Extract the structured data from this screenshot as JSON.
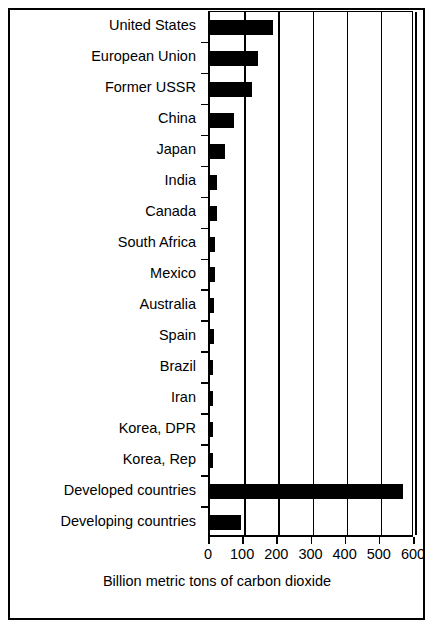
{
  "chart_data": {
    "type": "bar",
    "orientation": "horizontal",
    "title": "",
    "xlabel": "Billion metric tons of carbon dioxide",
    "ylabel": "",
    "xlim": [
      0,
      600
    ],
    "xticks": [
      0,
      100,
      200,
      300,
      400,
      500,
      600
    ],
    "xtick_labels": [
      "0",
      "100",
      "200",
      "300",
      "400",
      "500",
      "600"
    ],
    "grid": "vertical",
    "legend": "none",
    "bar_color": "#000000",
    "background_color": "#ffffff",
    "categories": [
      "United States",
      "European Union",
      "Former USSR",
      "China",
      "Japan",
      "India",
      "Canada",
      "South Africa",
      "Mexico",
      "Australia",
      "Spain",
      "Brazil",
      "Iran",
      "Korea, DPR",
      "Korea, Rep",
      "Developed countries",
      "Developing countries"
    ],
    "values": [
      185,
      141,
      124,
      70,
      44,
      21,
      21,
      15,
      15,
      12,
      12,
      10,
      9,
      9,
      9,
      565,
      91
    ]
  }
}
